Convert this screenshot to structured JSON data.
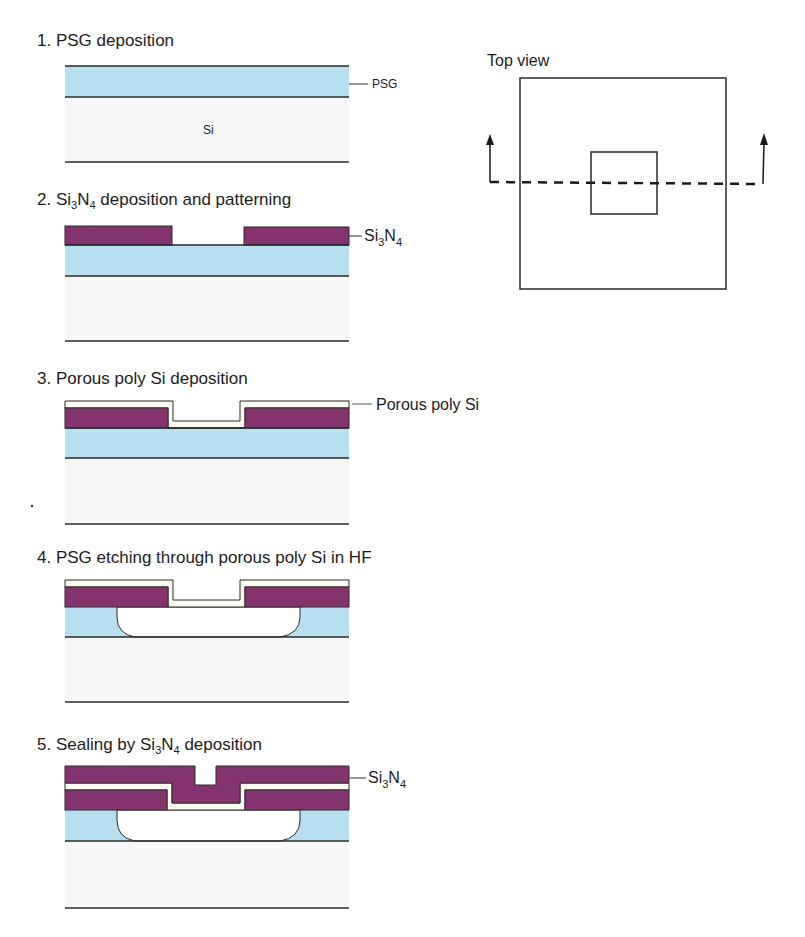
{
  "figure": {
    "colors": {
      "psg": "#b7dff0",
      "si3n4": "#84336f",
      "porous_poly_si": "#fbfaf0",
      "si": "#f7f7f7",
      "outline": "#2a2a2a"
    },
    "steps": [
      {
        "number": "1.",
        "title": "PSG deposition",
        "labels": [
          "PSG",
          "Si"
        ]
      },
      {
        "number": "2.",
        "title_pre": "Si",
        "title_sub": "3",
        "title_mid": "N",
        "title_sub2": "4",
        "title_post": " deposition and patterning",
        "label_pre": "Si",
        "label_sub": "3",
        "label_mid": "N",
        "label_sub2": "4"
      },
      {
        "number": "3.",
        "title": "Porous poly Si deposition",
        "label": "Porous poly Si"
      },
      {
        "number": "4.",
        "title": "PSG etching through porous poly Si in HF"
      },
      {
        "number": "5.",
        "title_pre": "Sealing by Si",
        "title_sub": "3",
        "title_mid": "N",
        "title_sub2": "4",
        "title_post": " deposition",
        "label_pre": "Si",
        "label_sub": "3",
        "label_mid": "N",
        "label_sub2": "4"
      }
    ],
    "top_view": {
      "title": "Top view"
    }
  }
}
